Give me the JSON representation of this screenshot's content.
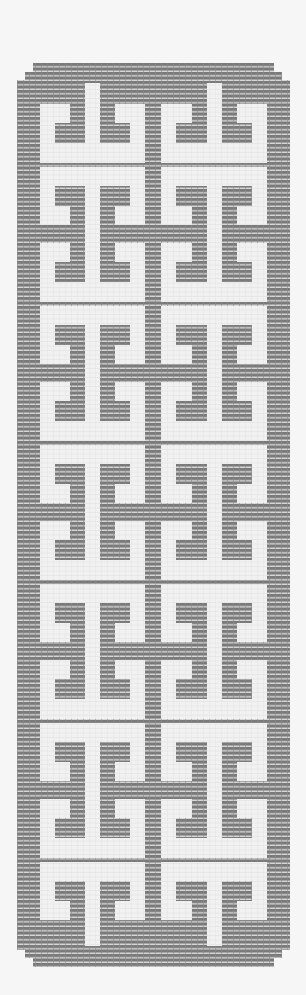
{
  "figure": {
    "colors": {
      "background": "#f6f6f6",
      "open_cell": "#f1f1f1",
      "filled_cell": "#7a7a7a",
      "filled_stripe": "#d8d8d8",
      "grid_line": "#e2e2e2"
    }
  },
  "chart_data": {
    "type": "heatmap",
    "title": "",
    "xlabel": "",
    "ylabel": "",
    "grid": true,
    "bounds_px": {
      "left": 17,
      "right": 290,
      "top": 63,
      "bottom": 967
    },
    "corner_steps_px": [
      [
        16,
        9
      ],
      [
        8,
        8
      ]
    ],
    "columns_px": {
      "left_half": {
        "frame_outer": 40,
        "hook1_start": 55,
        "hook1_notch": 70,
        "spine_start": 85,
        "spine_end": 100,
        "hook2_notch": 115,
        "hook2_end": 130,
        "frame_inner": 145
      },
      "right_half": {
        "frame_outer": 161,
        "hook1_start": 176,
        "hook1_notch": 192,
        "spine_start": 207,
        "spine_end": 222,
        "hook2_notch": 237,
        "hook2_end": 252,
        "frame_inner": 267
      }
    },
    "frame_rows_px": {
      "top_white": [
        0,
        19
      ],
      "hook_bar": [
        19,
        39
      ],
      "hook_notch": [
        39,
        58
      ],
      "middle_band": [
        58,
        76
      ],
      "hook_notch_lower": [
        76,
        95
      ],
      "hook_bar_lower": [
        95,
        115
      ],
      "bottom_white": [
        115,
        135
      ]
    },
    "frame_pitch_px": 139,
    "full_frame_tops_px": [
      167,
      306,
      445,
      584,
      723
    ],
    "top_cap": {
      "kind": "lower-half",
      "frame_top_px": 28,
      "spine_top_px": 83
    },
    "bottom_cap": {
      "kind": "upper-half",
      "frame_top_px": 862,
      "spine_bottom_px": 946
    },
    "legend": []
  }
}
